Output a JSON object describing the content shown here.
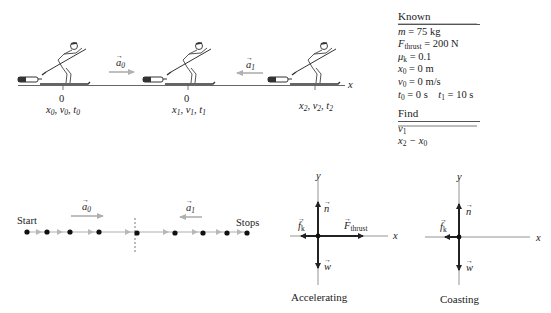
{
  "known": {
    "title": "Known",
    "items": [
      {
        "sym": "m",
        "sub": "",
        "rest": " = 75 kg"
      },
      {
        "sym": "F",
        "sub": "thrust",
        "rest": " = 200 N"
      },
      {
        "sym": "μ",
        "sub": "k",
        "rest": " = 0.1"
      },
      {
        "sym": "x",
        "sub": "0",
        "rest": " = 0 m"
      },
      {
        "sym": "v",
        "sub": "0",
        "rest": " = 0 m/s"
      },
      {
        "sym": "t",
        "sub": "0",
        "rest": " = 0 s    "
      },
      {
        "sym": "t",
        "sub": "1",
        "rest": " = 10 s"
      }
    ]
  },
  "find": {
    "title": "Find",
    "items": [
      {
        "text": "v",
        "sub": "1",
        "rest": ""
      },
      {
        "text": "x",
        "sub": "2",
        "rest": " − x",
        "sub2": "0"
      }
    ]
  },
  "pictorial": {
    "axis_label": "x",
    "points": [
      {
        "tick": "0",
        "label": "x0, v0, t0",
        "sym": [
          "x",
          "v",
          "t"
        ],
        "sub": "0"
      },
      {
        "tick": "0",
        "label": "x1, v1, t1",
        "sym": [
          "x",
          "v",
          "t"
        ],
        "sub": "1"
      },
      {
        "tick": "",
        "label": "x2, v2, t2",
        "sym": [
          "x",
          "v",
          "t"
        ],
        "sub": "2"
      }
    ],
    "accel_labels": [
      {
        "sym": "a",
        "sub": "0",
        "direction": "right"
      },
      {
        "sym": "a",
        "sub": "1",
        "direction": "left"
      }
    ]
  },
  "motion_diagram": {
    "start_label": "Start",
    "end_label": "Stops",
    "accel_labels": [
      {
        "sym": "a",
        "sub": "0",
        "direction": "right"
      },
      {
        "sym": "a",
        "sub": "1",
        "direction": "left"
      }
    ],
    "dot_x": [
      27,
      47,
      70,
      99,
      137,
      175,
      203,
      227,
      247
    ]
  },
  "fbd_accelerating": {
    "caption": "Accelerating",
    "x_axis": "x",
    "y_axis": "y",
    "forces": [
      {
        "name": "n",
        "sub": "",
        "direction": "up"
      },
      {
        "name": "w",
        "sub": "",
        "direction": "down"
      },
      {
        "name": "f",
        "sub": "k",
        "direction": "left"
      },
      {
        "name": "F",
        "sub": "thrust",
        "direction": "right"
      }
    ]
  },
  "fbd_coasting": {
    "caption": "Coasting",
    "x_axis": "x",
    "y_axis": "y",
    "forces": [
      {
        "name": "n",
        "sub": "",
        "direction": "up"
      },
      {
        "name": "w",
        "sub": "",
        "direction": "down"
      },
      {
        "name": "f",
        "sub": "k",
        "direction": "left"
      }
    ]
  },
  "colors": {
    "ink": "#222222",
    "gray_arrow": "#a8a8a8",
    "axis": "#888888"
  }
}
